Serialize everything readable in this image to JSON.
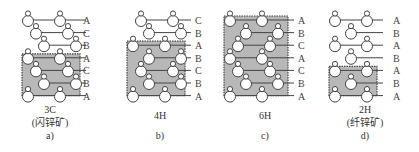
{
  "figure": {
    "panels": [
      {
        "id": "a",
        "polytype": "3C",
        "mineral": "(闪锌矿)",
        "sub_label": "a)",
        "stacking": [
          "A",
          "C",
          "B",
          "A",
          "C",
          "B",
          "A"
        ],
        "shaded_unit_cell_rows": [
          3,
          6
        ]
      },
      {
        "id": "b",
        "polytype": "4H",
        "mineral": "",
        "sub_label": "b)",
        "stacking": [
          "C",
          "B",
          "A",
          "B",
          "C",
          "B",
          "A"
        ],
        "shaded_unit_cell_rows": [
          2,
          6
        ]
      },
      {
        "id": "c",
        "polytype": "6H",
        "mineral": "",
        "sub_label": "c)",
        "stacking": [
          "A",
          "B",
          "C",
          "A",
          "C",
          "B",
          "A"
        ],
        "shaded_unit_cell_rows": [
          0,
          6
        ]
      },
      {
        "id": "d",
        "polytype": "2H",
        "mineral": "(纤锌矿)",
        "sub_label": "d)",
        "stacking": [
          "A",
          "B",
          "A",
          "B",
          "A",
          "B",
          "A"
        ],
        "shaded_unit_cell_rows": [
          4,
          6
        ]
      }
    ],
    "colors": {
      "shade": "#b8b8b8",
      "line": "#444444",
      "circle_fill": "#ffffff"
    }
  }
}
